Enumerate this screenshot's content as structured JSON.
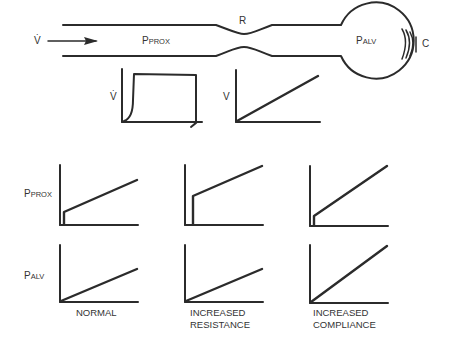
{
  "airway": {
    "flow_symbol": "V̇",
    "pprox_main": "P",
    "pprox_sub": "PROX",
    "resistance": "R",
    "palv_main": "P",
    "palv_sub": "ALV",
    "compliance": "C"
  },
  "small_graphs": {
    "flow_ylabel": "V̇",
    "volume_ylabel": "V"
  },
  "grid": {
    "row_labels": [
      {
        "main": "P",
        "sub": "PROX"
      },
      {
        "main": "P",
        "sub": "ALV"
      }
    ],
    "columns": [
      {
        "caption_line1": "NORMAL",
        "caption_line2": ""
      },
      {
        "caption_line1": "INCREASED",
        "caption_line2": "RESISTANCE"
      },
      {
        "caption_line1": "INCREASED",
        "caption_line2": "COMPLIANCE"
      }
    ]
  },
  "colors": {
    "stroke": "#2b2b2b",
    "background": "#ffffff"
  }
}
